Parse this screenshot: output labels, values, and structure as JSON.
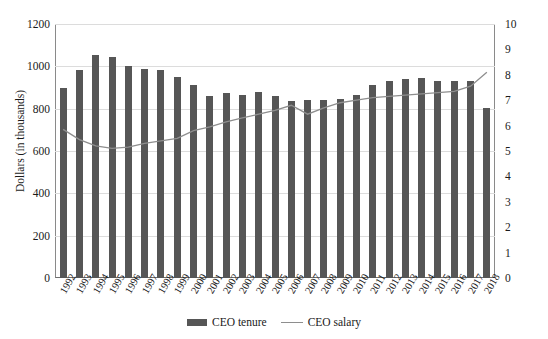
{
  "chart_data": {
    "type": "bar",
    "title": "",
    "subtitle": "",
    "xlabel": "",
    "ylabel": "Dollars (in thousands)",
    "y2label": "",
    "ylim": [
      0,
      1200
    ],
    "y2lim": [
      0,
      10
    ],
    "grid": true,
    "legend_position": "bottom",
    "categories": [
      "1992",
      "1993",
      "1994",
      "1995",
      "1996",
      "1997",
      "1998",
      "1999",
      "2000",
      "2001",
      "2002",
      "2003",
      "2004",
      "2005",
      "2006",
      "2007",
      "2008",
      "2009",
      "2010",
      "2011",
      "2012",
      "2013",
      "2014",
      "2015",
      "2016",
      "2017",
      "2018"
    ],
    "yticks": [
      0,
      200,
      400,
      600,
      800,
      1000,
      1200
    ],
    "y2ticks": [
      0,
      1,
      2,
      3,
      4,
      5,
      6,
      7,
      8,
      9,
      10
    ],
    "series": [
      {
        "name": "CEO tenure",
        "type": "bar",
        "axis": "left",
        "color": "#565656",
        "values": [
          900,
          985,
          1055,
          1043,
          1002,
          988,
          985,
          950,
          912,
          858,
          872,
          866,
          878,
          860,
          838,
          840,
          843,
          845,
          865,
          913,
          930,
          942,
          945,
          930,
          932,
          932,
          805
        ]
      },
      {
        "name": "CEO salary",
        "type": "line",
        "axis": "right",
        "color": "#8e8e8e",
        "values": [
          5.85,
          5.45,
          5.2,
          5.1,
          5.15,
          5.3,
          5.4,
          5.5,
          5.8,
          5.95,
          6.15,
          6.3,
          6.45,
          6.6,
          6.8,
          6.45,
          6.7,
          6.9,
          7.0,
          7.1,
          7.15,
          7.2,
          7.25,
          7.3,
          7.35,
          7.55,
          8.1
        ]
      }
    ]
  },
  "legend": {
    "items": [
      {
        "label": "CEO tenure",
        "marker": "bar-swatch"
      },
      {
        "label": "CEO salary",
        "marker": "line-swatch"
      }
    ]
  }
}
